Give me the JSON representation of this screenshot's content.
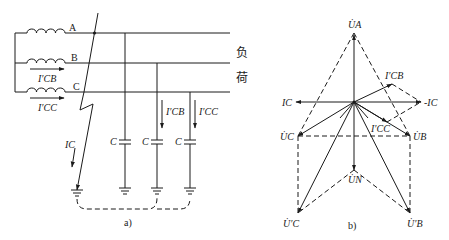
{
  "figure": {
    "panel_a": {
      "caption": "a)",
      "phases": [
        "A",
        "B",
        "C"
      ],
      "load_label_1": "负",
      "load_label_2": "荷",
      "currents": {
        "icb_source": "I′CB",
        "icc_source": "I′CC",
        "ic_fault": "IC",
        "icb_branch": "I′CB",
        "icc_branch": "I′CC"
      },
      "capacitor_label": "C"
    },
    "panel_b": {
      "caption": "b)",
      "phasors": {
        "ua": "U̇A",
        "ub": "U̇B",
        "uc": "U̇C",
        "un": "U̇N",
        "ub_prime": "U̇′B",
        "uc_prime": "U̇′C",
        "ic": "IC",
        "neg_ic": "-IC",
        "icb": "I′CB",
        "icc": "I′CC"
      }
    }
  }
}
